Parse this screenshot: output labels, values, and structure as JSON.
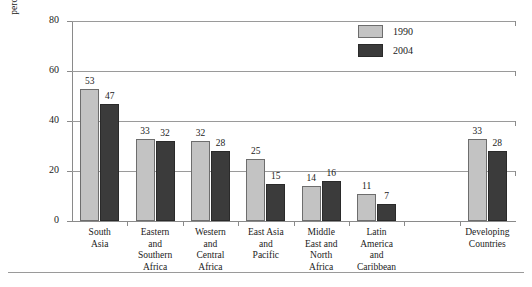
{
  "chart_data": {
    "type": "bar",
    "title": "",
    "subtitle": "",
    "xlabel": "",
    "ylabel_lines": [
      "percentage underweight children",
      "aged 0–59 months"
    ],
    "ylabel": "percentage underweight children aged 0–59 months",
    "ylim": [
      0,
      80
    ],
    "yticks": [
      0,
      20,
      40,
      60,
      80
    ],
    "ytick_labels": [
      "0",
      "20",
      "40",
      "60",
      "80"
    ],
    "grid": "horizontal",
    "legend_position": "top-right",
    "categories": [
      "South\nAsia",
      "Eastern\nand\nSouthern\nAfrica",
      "Western\nand\nCentral\nAfrica",
      "East Asia\nand\nPacific",
      "Middle\nEast and\nNorth\nAfrica",
      "Latin\nAmerica\nand\nCaribbean",
      "",
      "Developing\nCountries"
    ],
    "series": [
      {
        "name": "1990",
        "color": "#c3c3c3",
        "values": [
          53,
          33,
          32,
          25,
          14,
          11,
          null,
          33
        ]
      },
      {
        "name": "2004",
        "color": "#3b3b3b",
        "values": [
          47,
          32,
          28,
          15,
          16,
          7,
          null,
          28
        ]
      }
    ],
    "legend": [
      {
        "label": "1990",
        "color": "#c3c3c3"
      },
      {
        "label": "2004",
        "color": "#3b3b3b"
      }
    ]
  }
}
